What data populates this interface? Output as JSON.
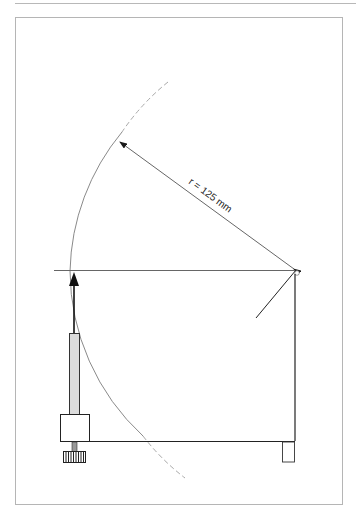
{
  "diagram": {
    "type": "technical-drawing",
    "label_radius": "r = 125 mm",
    "colors": {
      "line": "#2a2a2a",
      "frame": "#b5b5b5",
      "arc": "#8a8a8a",
      "arc_dashed": "#a5a5a5",
      "column_fill": "#dcdcdc"
    }
  }
}
